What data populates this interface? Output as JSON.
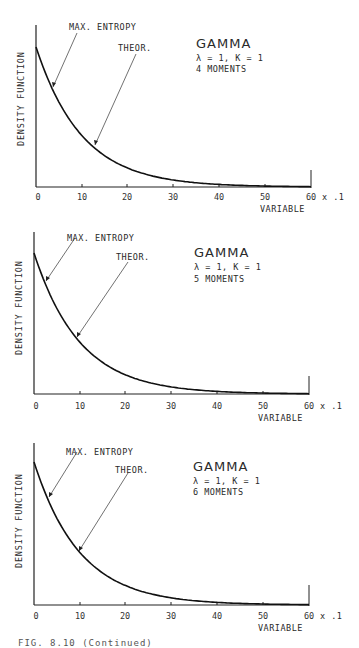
{
  "figure": {
    "caption_fragment": "FIG. 8.10  (Continued)"
  },
  "chart_data": [
    {
      "type": "line",
      "title": "GAMMA",
      "params": "λ = 1, K = 1",
      "moments": "4 MOMENTS",
      "xlabel": "VARIABLE",
      "ylabel": "DENSITY FUNCTION",
      "x_scale_note": "x .1",
      "xticks": [
        "0",
        "10",
        "20",
        "30",
        "40",
        "50",
        "60"
      ],
      "xlim": [
        0,
        60
      ],
      "grid": false,
      "annotations": [
        "MAX. ENTROPY",
        "THEOR."
      ],
      "series": [
        {
          "name": "MAX. ENTROPY",
          "x": [
            0,
            5,
            10,
            15,
            20,
            30,
            40,
            50,
            60
          ],
          "y": [
            1.0,
            0.61,
            0.37,
            0.22,
            0.14,
            0.05,
            0.02,
            0.007,
            0.002
          ]
        },
        {
          "name": "THEOR.",
          "x": [
            0,
            5,
            10,
            15,
            20,
            30,
            40,
            50,
            60
          ],
          "y": [
            1.0,
            0.61,
            0.37,
            0.22,
            0.14,
            0.05,
            0.02,
            0.007,
            0.002
          ]
        }
      ]
    },
    {
      "type": "line",
      "title": "GAMMA",
      "params": "λ = 1, K = 1",
      "moments": "5 MOMENTS",
      "xlabel": "VARIABLE",
      "ylabel": "DENSITY FUNCTION",
      "x_scale_note": "x .1",
      "xticks": [
        "0",
        "10",
        "20",
        "30",
        "40",
        "50",
        "60"
      ],
      "xlim": [
        0,
        60
      ],
      "grid": false,
      "annotations": [
        "MAX. ENTROPY",
        "THEOR."
      ],
      "series": [
        {
          "name": "MAX. ENTROPY",
          "x": [
            0,
            5,
            10,
            15,
            20,
            30,
            40,
            50,
            60
          ],
          "y": [
            1.0,
            0.61,
            0.37,
            0.22,
            0.14,
            0.05,
            0.02,
            0.007,
            0.002
          ]
        },
        {
          "name": "THEOR.",
          "x": [
            0,
            5,
            10,
            15,
            20,
            30,
            40,
            50,
            60
          ],
          "y": [
            1.0,
            0.61,
            0.37,
            0.22,
            0.14,
            0.05,
            0.02,
            0.007,
            0.002
          ]
        }
      ]
    },
    {
      "type": "line",
      "title": "GAMMA",
      "params": "λ = 1, K = 1",
      "moments": "6 MOMENTS",
      "xlabel": "VARIABLE",
      "ylabel": "DENSITY FUNCTION",
      "x_scale_note": "x .1",
      "xticks": [
        "0",
        "10",
        "20",
        "30",
        "40",
        "50",
        "60"
      ],
      "xlim": [
        0,
        60
      ],
      "grid": false,
      "annotations": [
        "MAX. ENTROPY",
        "THEOR."
      ],
      "series": [
        {
          "name": "MAX. ENTROPY",
          "x": [
            0,
            5,
            10,
            15,
            20,
            30,
            40,
            50,
            60
          ],
          "y": [
            1.0,
            0.61,
            0.37,
            0.22,
            0.14,
            0.05,
            0.02,
            0.007,
            0.002
          ]
        },
        {
          "name": "THEOR.",
          "x": [
            0,
            5,
            10,
            15,
            20,
            30,
            40,
            50,
            60
          ],
          "y": [
            1.0,
            0.61,
            0.37,
            0.22,
            0.14,
            0.05,
            0.02,
            0.007,
            0.002
          ]
        }
      ]
    }
  ],
  "panels": [
    {
      "title": "GAMMA",
      "params": "λ = 1, K = 1",
      "moments": "4 MOMENTS",
      "ylabel": "DENSITY FUNCTION",
      "xlabel": "VARIABLE",
      "xscale": "x .1",
      "ann_max": "MAX. ENTROPY",
      "ann_theor": "THEOR.",
      "ticks": [
        "0",
        "10",
        "20",
        "30",
        "40",
        "50",
        "60"
      ]
    },
    {
      "title": "GAMMA",
      "params": "λ = 1, K = 1",
      "moments": "5 MOMENTS",
      "ylabel": "DENSITY FUNCTION",
      "xlabel": "VARIABLE",
      "xscale": "x .1",
      "ann_max": "MAX. ENTROPY",
      "ann_theor": "THEOR.",
      "ticks": [
        "0",
        "10",
        "20",
        "30",
        "40",
        "50",
        "60"
      ]
    },
    {
      "title": "GAMMA",
      "params": "λ = 1, K = 1",
      "moments": "6 MOMENTS",
      "ylabel": "DENSITY FUNCTION",
      "xlabel": "VARIABLE",
      "xscale": "x .1",
      "ann_max": "MAX. ENTROPY",
      "ann_theor": "THEOR.",
      "ticks": [
        "0",
        "10",
        "20",
        "30",
        "40",
        "50",
        "60"
      ]
    }
  ]
}
